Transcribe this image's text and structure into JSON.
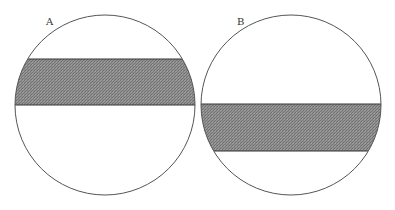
{
  "figure": {
    "panels": [
      {
        "label": "A",
        "circle": {
          "cx": 105,
          "cy": 105,
          "r": 90
        },
        "band": {
          "y_top": 59,
          "y_bottom": 105
        },
        "label_pos": {
          "x": 46,
          "y": 25
        }
      },
      {
        "label": "B",
        "circle": {
          "cx": 291,
          "cy": 105,
          "r": 90
        },
        "band": {
          "y_top": 104,
          "y_bottom": 151
        },
        "label_pos": {
          "x": 237,
          "y": 25
        }
      }
    ],
    "colors": {
      "outline": "#555555",
      "band_fill": "#8a8a8a",
      "background": "#ffffff"
    }
  }
}
